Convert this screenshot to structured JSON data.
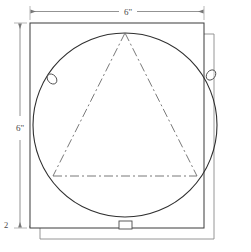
{
  "drawing": {
    "title_text": "",
    "colors": {
      "outline": "#3b3b3b",
      "circle": "#2f2f2f",
      "centerline": "#6a6a6a",
      "dimension": "#777777",
      "text": "#4a4a4a",
      "background": "#ffffff",
      "offset_plate": "#8a8a8a"
    },
    "dimensions": [
      {
        "id": "top-width",
        "label": "6\"",
        "orientation": "horizontal",
        "position": "top"
      },
      {
        "id": "left-height",
        "label": "6\"",
        "orientation": "vertical",
        "position": "left"
      },
      {
        "id": "bottom-left-thickness",
        "label": "2",
        "orientation": "vertical",
        "position": "bottom-left"
      }
    ],
    "shapes": {
      "plate_front": {
        "name": "square-plate",
        "x": 30,
        "y": 23,
        "width": 174,
        "height": 205
      },
      "plate_back": {
        "name": "offset-square-plate",
        "x": 40,
        "y": 34,
        "width": 174,
        "height": 205
      },
      "circle": {
        "name": "inscribed-circle",
        "cx": 125,
        "cy": 125,
        "r": 92
      },
      "triangle": {
        "name": "inscribed-triangle",
        "points": "125,33 53,176 197,176",
        "line_style": "dash-dot"
      }
    },
    "markers": [
      {
        "id": "marker-left",
        "type": "oval",
        "cx": 52,
        "cy": 79,
        "rx": 4.2,
        "ry": 5.6,
        "rotation": -42
      },
      {
        "id": "marker-right",
        "type": "oval",
        "cx": 211,
        "cy": 75,
        "rx": 4.2,
        "ry": 5.6,
        "rotation": 38
      },
      {
        "id": "marker-bottom",
        "type": "rectangle",
        "x": 119,
        "y": 221,
        "width": 13,
        "height": 8
      }
    ]
  }
}
